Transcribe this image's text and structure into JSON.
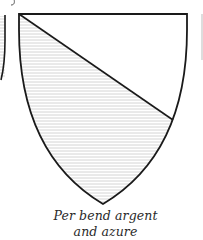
{
  "figure": {
    "title": "Per bend argent and azure",
    "caption": {
      "line1": "Per bend argent",
      "line2": "and azure"
    },
    "shield": {
      "division": "per bend",
      "upper_tincture": "argent",
      "lower_tincture": "azure",
      "outline_color": "#1a1a1a",
      "argent_fill": "#ffffff",
      "azure_hatch_color": "#c8c8c8"
    },
    "neighbor_fragments": {
      "left_shield_edge": true,
      "right_shield_edge": true
    }
  }
}
